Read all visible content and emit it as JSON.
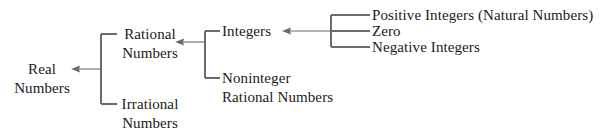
{
  "diagram": {
    "type": "tree-hierarchy",
    "orientation": "right-to-left",
    "line_color": "#6b6b6b",
    "text_color": "#1a1a1a",
    "background_color": "#ffffff",
    "nodes": {
      "real_numbers": "Real\nNumbers",
      "rational_numbers": "Rational\nNumbers",
      "irrational_numbers": "Irrational\nNumbers",
      "integers": "Integers",
      "noninteger_rational_numbers": "Noninteger\nRational Numbers",
      "positive_integers": "Positive Integers (Natural Numbers)",
      "zero": "Zero",
      "negative_integers": "Negative Integers"
    },
    "edges": [
      {
        "from": "rational_numbers",
        "to": "real_numbers"
      },
      {
        "from": "irrational_numbers",
        "to": "real_numbers"
      },
      {
        "from": "integers",
        "to": "rational_numbers"
      },
      {
        "from": "noninteger_rational_numbers",
        "to": "rational_numbers"
      },
      {
        "from": "positive_integers",
        "to": "integers"
      },
      {
        "from": "zero",
        "to": "integers"
      },
      {
        "from": "negative_integers",
        "to": "integers"
      }
    ]
  }
}
